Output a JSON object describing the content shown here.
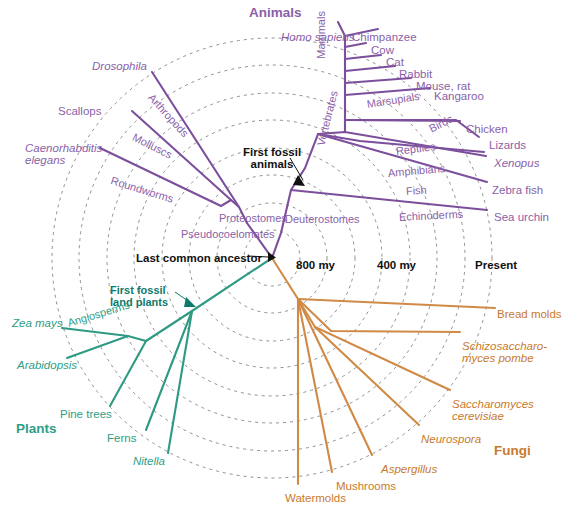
{
  "figure": {
    "type": "radial-phylogenetic-tree",
    "root_label": "Last common ancestor",
    "root_age": "800 my"
  },
  "colors": {
    "animals": "#8a5fa8",
    "animals_line": "#7c4f9c",
    "plants": "#2e9e86",
    "plants_line": "#2f9a83",
    "fungi": "#c87a2e",
    "fungi_line": "#d08a45",
    "grid": "#8a8a8a",
    "text_black": "#111111"
  },
  "kingdoms": {
    "animals": "Animals",
    "plants": "Plants",
    "fungi": "Fungi"
  },
  "timescale": {
    "ticks": [
      {
        "label": "800 my",
        "x": 296,
        "y": 259
      },
      {
        "label": "400 my",
        "x": 377,
        "y": 259
      },
      {
        "label": "Present",
        "x": 475,
        "y": 259
      }
    ]
  },
  "annotations": [
    {
      "name": "last-common-ancestor",
      "text": "Last common ancestor",
      "x": 136,
      "y": 252,
      "color": "#111111",
      "bold": false
    },
    {
      "name": "first-fossil-animals",
      "text": "First fossil animals",
      "x": 241,
      "y": 146,
      "color": "#111111",
      "bold": false
    },
    {
      "name": "first-fossil-land-plants",
      "text": "First fossil land plants",
      "x": 110,
      "y": 284,
      "color": "#0f7a6a",
      "bold": true
    }
  ],
  "taxa": {
    "animals_tips": [
      {
        "label": "Homo sapiens",
        "italic": true,
        "x": 281,
        "y": 31
      },
      {
        "label": "Chimpanzee",
        "italic": false,
        "x": 352,
        "y": 31
      },
      {
        "label": "Cow",
        "italic": false,
        "x": 371,
        "y": 44
      },
      {
        "label": "Cat",
        "italic": false,
        "x": 386,
        "y": 56
      },
      {
        "label": "Rabbit",
        "italic": false,
        "x": 399,
        "y": 68
      },
      {
        "label": "Mouse, rat",
        "italic": false,
        "x": 416,
        "y": 80
      },
      {
        "label": "Kangaroo",
        "italic": false,
        "x": 434,
        "y": 90
      },
      {
        "label": "Chicken",
        "italic": false,
        "x": 466,
        "y": 123
      },
      {
        "label": "Lizards",
        "italic": false,
        "x": 489,
        "y": 139
      },
      {
        "label": "Xenopus",
        "italic": true,
        "x": 494,
        "y": 157
      },
      {
        "label": "Zebra fish",
        "italic": false,
        "x": 492,
        "y": 184
      },
      {
        "label": "Sea urchin",
        "italic": false,
        "x": 494,
        "y": 211
      },
      {
        "label": "Drosophila",
        "italic": true,
        "x": 92,
        "y": 60
      },
      {
        "label": "Scallops",
        "italic": false,
        "x": 58,
        "y": 105
      },
      {
        "label": "Caenorhabditis elegans",
        "italic": true,
        "x": 25,
        "y": 142
      }
    ],
    "animals_internal": [
      {
        "label": "Mammals",
        "x": 322,
        "y": 53,
        "rot": -90
      },
      {
        "label": "Marsupials",
        "x": 367,
        "y": 99,
        "rot": -9
      },
      {
        "label": "Birds",
        "x": 430,
        "y": 124,
        "rot": -27
      },
      {
        "label": "Reptiles",
        "x": 396,
        "y": 146,
        "rot": -7
      },
      {
        "label": "Amphibians",
        "x": 388,
        "y": 168,
        "rot": -5
      },
      {
        "label": "Fish",
        "x": 406,
        "y": 186,
        "rot": -4
      },
      {
        "label": "Echinoderms",
        "x": 399,
        "y": 212,
        "rot": -3
      },
      {
        "label": "Vertebrates",
        "x": 321,
        "y": 140,
        "rot": -76
      },
      {
        "label": "Deuterostomes",
        "x": 285,
        "y": 214,
        "rot": 0
      },
      {
        "label": "Proteostomes",
        "x": 219,
        "y": 213,
        "rot": 0
      },
      {
        "label": "Pseudocoelomates",
        "x": 181,
        "y": 229,
        "rot": 0
      },
      {
        "label": "Arthropods",
        "x": 150,
        "y": 90,
        "rot": 48
      },
      {
        "label": "Molluscs",
        "x": 133,
        "y": 131,
        "rot": 27
      },
      {
        "label": "Roundworms",
        "x": 111,
        "y": 175,
        "rot": 17
      }
    ],
    "plants_tips": [
      {
        "label": "Zea mays",
        "italic": true,
        "x": 12,
        "y": 317
      },
      {
        "label": "Arabidopsis",
        "italic": true,
        "x": 17,
        "y": 359
      },
      {
        "label": "Pine trees",
        "italic": false,
        "x": 60,
        "y": 408
      },
      {
        "label": "Ferns",
        "italic": false,
        "x": 107,
        "y": 432
      },
      {
        "label": "Nitella",
        "italic": true,
        "x": 133,
        "y": 455
      }
    ],
    "plants_internal": [
      {
        "label": "Angiosperms",
        "x": 68,
        "y": 318,
        "rot": -17
      }
    ],
    "fungi_tips": [
      {
        "label": "Bread molds",
        "italic": false,
        "x": 497,
        "y": 308
      },
      {
        "label": "Schizosaccharo- myces pombe",
        "italic": true,
        "x": 462,
        "y": 340
      },
      {
        "label": "Saccharomyces cerevisiae",
        "italic": true,
        "x": 452,
        "y": 398
      },
      {
        "label": "Neurospora",
        "italic": true,
        "x": 421,
        "y": 433
      },
      {
        "label": "Aspergillus",
        "italic": true,
        "x": 381,
        "y": 463
      },
      {
        "label": "Mushrooms",
        "italic": false,
        "x": 336,
        "y": 480
      },
      {
        "label": "Watermolds",
        "italic": false,
        "x": 285,
        "y": 492
      }
    ]
  },
  "chart_data": {
    "type": "diagram",
    "root": {
      "x": 272,
      "y": 258
    },
    "grid_radii": [
      28,
      55,
      83,
      110,
      138,
      165,
      193,
      220
    ],
    "branches_animals": [
      [
        [
          272,
          258
        ],
        [
          240,
          211
        ],
        [
          152,
          73
        ]
      ],
      [
        [
          240,
          211
        ],
        [
          228,
          204
        ],
        [
          133,
          112
        ]
      ],
      [
        [
          228,
          204
        ],
        [
          216,
          208
        ],
        [
          101,
          148
        ]
      ],
      [
        [
          272,
          258
        ],
        [
          281,
          215
        ],
        [
          292,
          188
        ],
        [
          318,
          135
        ]
      ],
      [
        [
          292,
          188
        ],
        [
          487,
          210
        ]
      ],
      [
        [
          318,
          135
        ],
        [
          345,
          120
        ],
        [
          345,
          36
        ],
        [
          380,
          30
        ]
      ],
      [
        [
          345,
          36
        ],
        [
          337,
          22
        ]
      ],
      [
        [
          345,
          47
        ],
        [
          366,
          43
        ]
      ],
      [
        [
          345,
          59
        ],
        [
          381,
          55
        ]
      ],
      [
        [
          345,
          71
        ],
        [
          394,
          67
        ]
      ],
      [
        [
          345,
          83
        ],
        [
          411,
          79
        ]
      ],
      [
        [
          345,
          95
        ],
        [
          429,
          89
        ]
      ],
      [
        [
          345,
          120
        ],
        [
          460,
          122
        ]
      ],
      [
        [
          345,
          120
        ],
        [
          457,
          120
        ],
        [
          480,
          138
        ]
      ],
      [
        [
          318,
          135
        ],
        [
          485,
          156
        ]
      ],
      [
        [
          318,
          135
        ],
        [
          305,
          152
        ],
        [
          485,
          183
        ]
      ]
    ]
  }
}
